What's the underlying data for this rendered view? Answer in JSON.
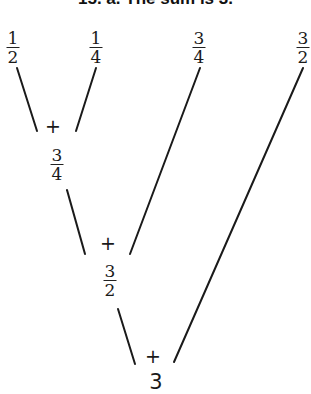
{
  "title": "15. a. The sum is 3.",
  "tree": {
    "leaves": [
      {
        "num": "1",
        "den": "2",
        "value": 0.5
      },
      {
        "num": "1",
        "den": "4",
        "value": 0.25
      },
      {
        "num": "3",
        "den": "4",
        "value": 0.75
      },
      {
        "num": "3",
        "den": "2",
        "value": 1.5
      }
    ],
    "operations": [
      {
        "operator": "+",
        "inputs": [
          "1/2",
          "1/4"
        ],
        "result": {
          "num": "3",
          "den": "4"
        }
      },
      {
        "operator": "+",
        "inputs": [
          "3/4",
          "3/4"
        ],
        "result": {
          "num": "3",
          "den": "2"
        }
      },
      {
        "operator": "+",
        "inputs": [
          "3/2",
          "3/2"
        ],
        "result": {
          "whole": "3"
        }
      }
    ]
  },
  "colors": {
    "ink": "#1a1a1a",
    "background": "#ffffff"
  }
}
